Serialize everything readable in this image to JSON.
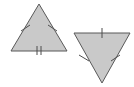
{
  "figure": {
    "background_color": "#ffffff",
    "canvas": {
      "width": 134,
      "height": 87
    },
    "fill_color": "#c9c9c9",
    "stroke_color": "#595959",
    "tick_color": "#4d4d4d",
    "stroke_width": 1,
    "tick_width": 1
  },
  "shapes": [
    {
      "id": "left-triangle",
      "name": "upright-isosceles-triangle",
      "orientation": "apex-up",
      "points": "39,4 11,51 67,51",
      "vertices": [
        {
          "label": "apex",
          "x": 39,
          "y": 4
        },
        {
          "label": "bottom-left",
          "x": 11,
          "y": 51
        },
        {
          "label": "bottom-right",
          "x": 67,
          "y": 51
        }
      ],
      "sides": [
        {
          "name": "left-side",
          "ticks": 1
        },
        {
          "name": "right-side",
          "ticks": 1
        },
        {
          "name": "base",
          "ticks": 2
        }
      ]
    },
    {
      "id": "right-triangle",
      "name": "inverted-isosceles-triangle",
      "orientation": "apex-down",
      "points": "74,33 130,33 102,83",
      "vertices": [
        {
          "label": "top-left",
          "x": 74,
          "y": 33
        },
        {
          "label": "top-right",
          "x": 130,
          "y": 33
        },
        {
          "label": "apex",
          "x": 102,
          "y": 83
        }
      ],
      "sides": [
        {
          "name": "top-side",
          "ticks": 1
        },
        {
          "name": "left-side",
          "ticks": 1
        },
        {
          "name": "right-side",
          "ticks": 1
        }
      ]
    }
  ],
  "tick_marks": [
    {
      "id": "left-tri-left-tick",
      "shape": "left-triangle",
      "side": "left-side",
      "count": 1,
      "x1": 21,
      "y1": 31,
      "x2": 30,
      "y2": 25
    },
    {
      "id": "left-tri-right-tick",
      "shape": "left-triangle",
      "side": "right-side",
      "count": 1,
      "x1": 48,
      "y1": 25,
      "x2": 57,
      "y2": 31
    },
    {
      "id": "left-tri-base-tick-a",
      "shape": "left-triangle",
      "side": "base",
      "count": 2,
      "x1": 37,
      "y1": 46,
      "x2": 37,
      "y2": 55
    },
    {
      "id": "left-tri-base-tick-b",
      "shape": "left-triangle",
      "side": "base",
      "count": 2,
      "x1": 41,
      "y1": 46,
      "x2": 41,
      "y2": 55
    },
    {
      "id": "right-tri-top-tick",
      "shape": "right-triangle",
      "side": "top-side",
      "count": 1,
      "x1": 102,
      "y1": 28,
      "x2": 102,
      "y2": 38
    },
    {
      "id": "right-tri-left-tick",
      "shape": "right-triangle",
      "side": "left-side",
      "count": 1,
      "x1": 79,
      "y1": 55,
      "x2": 89,
      "y2": 61
    },
    {
      "id": "right-tri-right-tick",
      "shape": "right-triangle",
      "side": "right-side",
      "count": 1,
      "x1": 111,
      "y1": 61,
      "x2": 120,
      "y2": 55
    }
  ]
}
